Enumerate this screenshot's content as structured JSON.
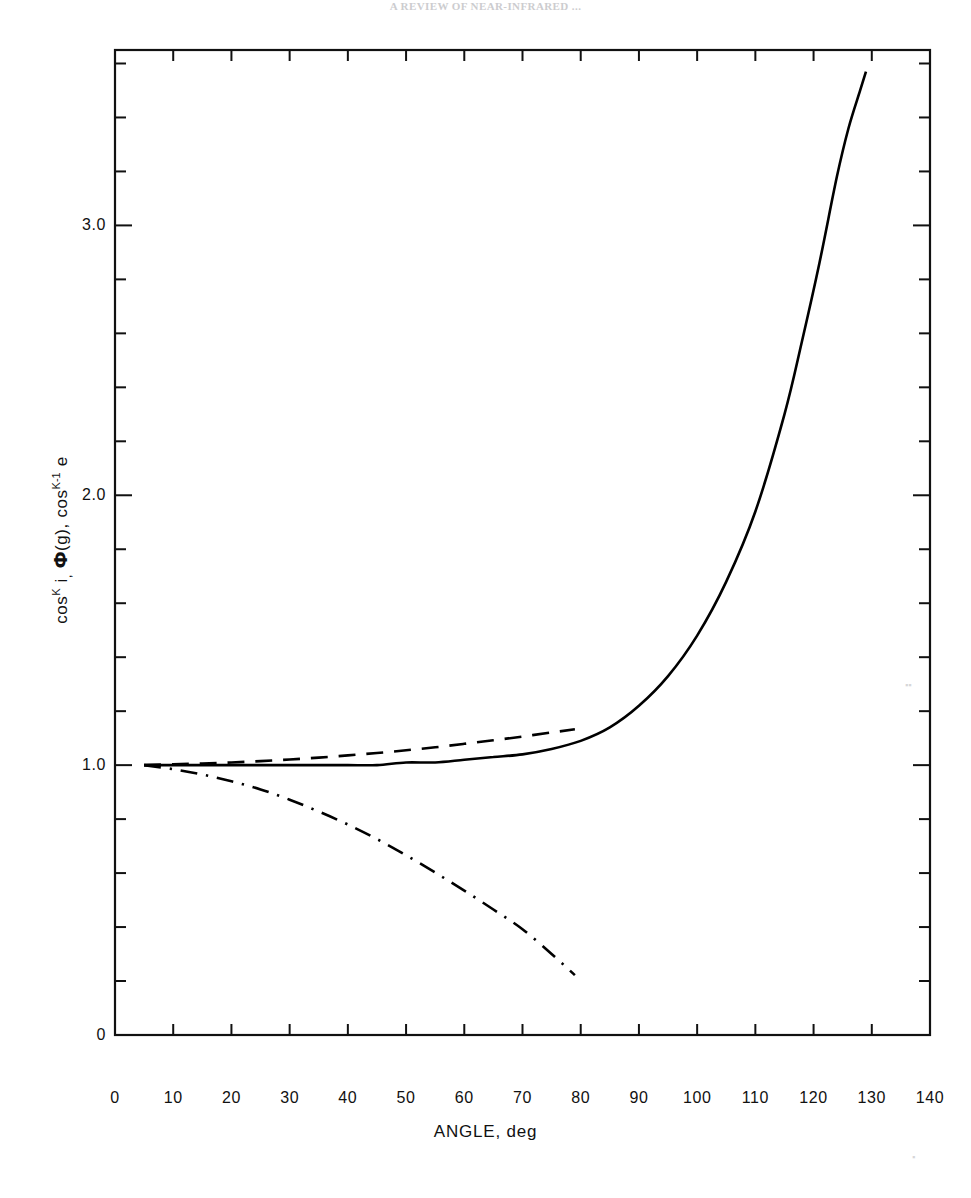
{
  "header": {
    "cropped_text": "A REVIEW OF NEAR-INFRARED ..."
  },
  "figure": {
    "x_axis_title": "ANGLE, deg",
    "y_axis_title_parts": {
      "cos1": "cos",
      "sup_K": "K",
      "i": "i",
      "comma1": ",",
      "phi": "Ф",
      "g": "(g)",
      "comma2": ",",
      "cos2": "cos",
      "sup_Km1": "K-1",
      "e": "e"
    },
    "y_axis_title_plain": "cos^K i, Ф(g), cos^K-1 e"
  },
  "chart_data": {
    "type": "line",
    "title": "",
    "subtitle": "",
    "xlabel": "ANGLE, deg",
    "ylabel": "cos^K i, Ф(g), cos^K-1 e",
    "xlim": [
      0,
      140
    ],
    "ylim": [
      0,
      3.65
    ],
    "xticks": [
      0,
      10,
      20,
      30,
      40,
      50,
      60,
      70,
      80,
      90,
      100,
      110,
      120,
      130,
      140
    ],
    "xtick_labels": [
      "0",
      "10",
      "20",
      "30",
      "40",
      "50",
      "60",
      "70",
      "80",
      "90",
      "100",
      "110",
      "120",
      "130",
      "140"
    ],
    "yticks": [
      0,
      1.0,
      2.0,
      3.0
    ],
    "ytick_labels": [
      "0",
      "1.0",
      "2.0",
      "3.0"
    ],
    "y_minor_tick_step": 0.2,
    "x_minor_ticks": false,
    "grid": false,
    "legend": "none",
    "frame": "full-box",
    "series": [
      {
        "name": "cos^K i",
        "linestyle": "solid",
        "color": "#000000",
        "linewidth": 2.6,
        "x": [
          5,
          10,
          15,
          20,
          25,
          30,
          35,
          40,
          45,
          50,
          55,
          60,
          65,
          70,
          75,
          80,
          85,
          90,
          95,
          100,
          105,
          110,
          115,
          118,
          121,
          124,
          126,
          128,
          129
        ],
        "y": [
          1.0,
          1.0,
          1.0,
          1.0,
          1.0,
          1.0,
          1.0,
          1.0,
          1.0,
          1.01,
          1.01,
          1.02,
          1.03,
          1.04,
          1.06,
          1.09,
          1.14,
          1.22,
          1.33,
          1.48,
          1.68,
          1.94,
          2.3,
          2.57,
          2.86,
          3.18,
          3.36,
          3.5,
          3.57
        ]
      },
      {
        "name": "Ф(g)",
        "linestyle": "dashed",
        "color": "#000000",
        "linewidth": 2.6,
        "x": [
          5,
          10,
          15,
          20,
          25,
          30,
          35,
          40,
          45,
          50,
          55,
          60,
          65,
          70,
          75,
          79
        ],
        "y": [
          1.0,
          1.003,
          1.006,
          1.01,
          1.015,
          1.021,
          1.028,
          1.036,
          1.045,
          1.055,
          1.066,
          1.079,
          1.092,
          1.106,
          1.121,
          1.133
        ]
      },
      {
        "name": "cos^K-1 e",
        "linestyle": "dashdot",
        "color": "#000000",
        "linewidth": 2.6,
        "x": [
          5,
          10,
          15,
          20,
          25,
          30,
          35,
          40,
          45,
          50,
          55,
          60,
          65,
          70,
          75,
          79
        ],
        "y": [
          1.0,
          0.985,
          0.965,
          0.94,
          0.91,
          0.872,
          0.828,
          0.78,
          0.726,
          0.666,
          0.602,
          0.535,
          0.465,
          0.392,
          0.3,
          0.222
        ]
      }
    ]
  }
}
